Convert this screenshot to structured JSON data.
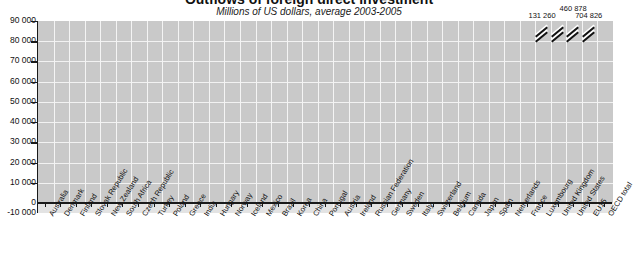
{
  "chart_data": {
    "type": "bar",
    "title": "Outflows of foreign direct investment",
    "subtitle": "Millions of US dollars, average 2003-2005",
    "xlabel": "",
    "ylabel": "",
    "ylim": [
      -10000,
      90000
    ],
    "yticks": [
      "-10 000",
      "0",
      "10 000",
      "20 000",
      "30 000",
      "40 000",
      "50 000",
      "60 000",
      "70 000",
      "80 000",
      "90 000"
    ],
    "grid": true,
    "legend": "none",
    "categories": [
      "Australia",
      "Denmark",
      "Finland",
      "Slovak Republic",
      "New Zealand",
      "South Africa",
      "Czech Republic",
      "Turkey",
      "Poland",
      "Greece",
      "India",
      "Hungary",
      "Norway",
      "Iceland",
      "Mexico",
      "Brazil",
      "Korea",
      "China",
      "Portugal",
      "Austria",
      "Ireland",
      "Russian Federation",
      "Germany",
      "Sweden",
      "Italy",
      "Switzerland",
      "Belgium",
      "Canada",
      "Japan",
      "Spain",
      "Netherlands",
      "France",
      "Luxembourg",
      "United Kingdom",
      "United States",
      "EU15",
      "OECD total"
    ],
    "values": [
      -2700,
      700,
      1100,
      200,
      300,
      400,
      500,
      500,
      700,
      900,
      1100,
      1300,
      1800,
      2000,
      3000,
      3300,
      4000,
      5000,
      6800,
      7700,
      11000,
      12000,
      14000,
      16500,
      19000,
      22000,
      23500,
      27000,
      31000,
      43000,
      62000,
      77000,
      80000,
      89000,
      89000,
      89000,
      89000
    ],
    "clipped_values": [
      {
        "category": "Luxembourg",
        "label": "131 260"
      },
      {
        "category": "United States",
        "label": "460 878"
      },
      {
        "category": "EU15",
        "label": "704 826"
      }
    ]
  }
}
